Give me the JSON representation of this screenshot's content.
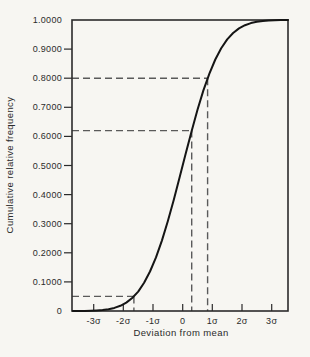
{
  "chart_data": {
    "type": "line",
    "title": "",
    "xlabel": "Deviation from mean",
    "ylabel": "Cumulative relative frequency",
    "xlim": [
      -3.73,
      3.55
    ],
    "ylim": [
      0,
      1
    ],
    "grid": false,
    "legend": null,
    "x_ticks": [
      {
        "value": -3,
        "label": "-3σ"
      },
      {
        "value": -2,
        "label": "-2σ"
      },
      {
        "value": -1,
        "label": "-1σ"
      },
      {
        "value": 0,
        "label": "0"
      },
      {
        "value": 1,
        "label": "1σ"
      },
      {
        "value": 2,
        "label": "2σ"
      },
      {
        "value": 3,
        "label": "3σ"
      }
    ],
    "y_ticks": [
      {
        "value": 0.0,
        "label": "0"
      },
      {
        "value": 0.1,
        "label": "0.1000"
      },
      {
        "value": 0.2,
        "label": "0.2000"
      },
      {
        "value": 0.3,
        "label": "0.3000"
      },
      {
        "value": 0.4,
        "label": "0.4000"
      },
      {
        "value": 0.5,
        "label": "0.5000"
      },
      {
        "value": 0.6,
        "label": "0.6000"
      },
      {
        "value": 0.7,
        "label": "0.7000"
      },
      {
        "value": 0.8,
        "label": "0.8000"
      },
      {
        "value": 0.9,
        "label": "0.9000"
      },
      {
        "value": 1.0,
        "label": "1.0000"
      }
    ],
    "series": [
      {
        "name": "normal-cdf",
        "points": [
          [
            -3.7,
            0.0001
          ],
          [
            -3.5,
            0.0002
          ],
          [
            -3.3,
            0.0005
          ],
          [
            -3.1,
            0.001
          ],
          [
            -2.9,
            0.0019
          ],
          [
            -2.7,
            0.0035
          ],
          [
            -2.5,
            0.0062
          ],
          [
            -2.3,
            0.0107
          ],
          [
            -2.1,
            0.0179
          ],
          [
            -1.9,
            0.0287
          ],
          [
            -1.7,
            0.0446
          ],
          [
            -1.5,
            0.0668
          ],
          [
            -1.3,
            0.0968
          ],
          [
            -1.1,
            0.1357
          ],
          [
            -0.9,
            0.1841
          ],
          [
            -0.7,
            0.242
          ],
          [
            -0.5,
            0.3085
          ],
          [
            -0.3,
            0.3821
          ],
          [
            -0.1,
            0.4602
          ],
          [
            0.1,
            0.5398
          ],
          [
            0.3,
            0.6179
          ],
          [
            0.5,
            0.6915
          ],
          [
            0.7,
            0.758
          ],
          [
            0.9,
            0.8159
          ],
          [
            1.1,
            0.8643
          ],
          [
            1.3,
            0.9032
          ],
          [
            1.5,
            0.9332
          ],
          [
            1.7,
            0.9554
          ],
          [
            1.9,
            0.9713
          ],
          [
            2.1,
            0.9821
          ],
          [
            2.3,
            0.9893
          ],
          [
            2.5,
            0.9938
          ],
          [
            2.7,
            0.9965
          ],
          [
            2.9,
            0.9981
          ],
          [
            3.1,
            0.999
          ],
          [
            3.3,
            0.9995
          ],
          [
            3.5,
            0.9998
          ],
          [
            3.55,
            0.9998
          ]
        ]
      }
    ],
    "guides": [
      {
        "x": -1.645,
        "y": 0.05
      },
      {
        "x": 0.305,
        "y": 0.62
      },
      {
        "x": 0.8416,
        "y": 0.8
      }
    ],
    "colors": {
      "frame": "#2b2b2b",
      "curve": "#151515",
      "dashed": "#5a5a5a",
      "text": "#2b2b2b",
      "background": "#f7f6f2"
    }
  }
}
